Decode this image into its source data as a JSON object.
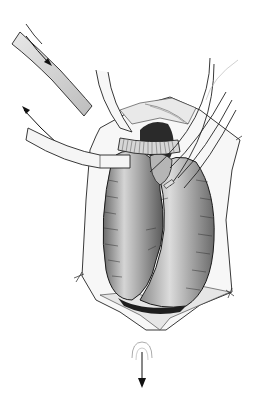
{
  "figure": {
    "style": "grayscale pen-and-ink with shading",
    "background": "#ffffff",
    "colors": {
      "ink": "#1a1a1a",
      "shade_dark": "#2a2a2a",
      "shade_mid": "#9a9a9a",
      "shade_light": "#d8d8d8",
      "tube": "#f4f4f4"
    },
    "elements": [
      "venous-cannula-tube",
      "inflow-arrow",
      "outflow-arrow",
      "ribbed-aortic-cannula",
      "vent-catheters",
      "pericardial-incision",
      "heart",
      "drain-arrow"
    ]
  }
}
